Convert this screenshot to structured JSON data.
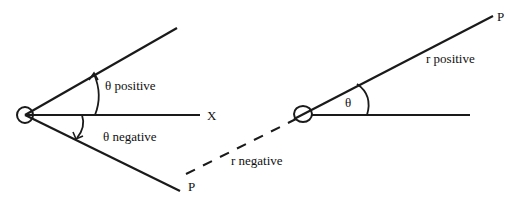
{
  "diagram": {
    "colors": {
      "stroke": "#1a1a1a",
      "background": "#ffffff"
    },
    "left_panel": {
      "axis_label": "X",
      "theta_positive_label": "θ positive",
      "theta_negative_label": "θ negative",
      "point_label": "P"
    },
    "right_panel": {
      "theta_label": "θ",
      "r_positive_label": "r positive",
      "r_negative_label": "r negative",
      "point_label": "P"
    }
  }
}
